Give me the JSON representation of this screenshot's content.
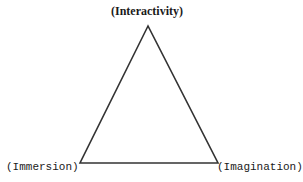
{
  "diagram": {
    "type": "triangle",
    "line_color": "#333333",
    "vertices": {
      "top": {
        "label": "(Interactivity)"
      },
      "bottom_left": {
        "label": "(Immersion)"
      },
      "bottom_right": {
        "label": "(Imagination)"
      }
    }
  }
}
